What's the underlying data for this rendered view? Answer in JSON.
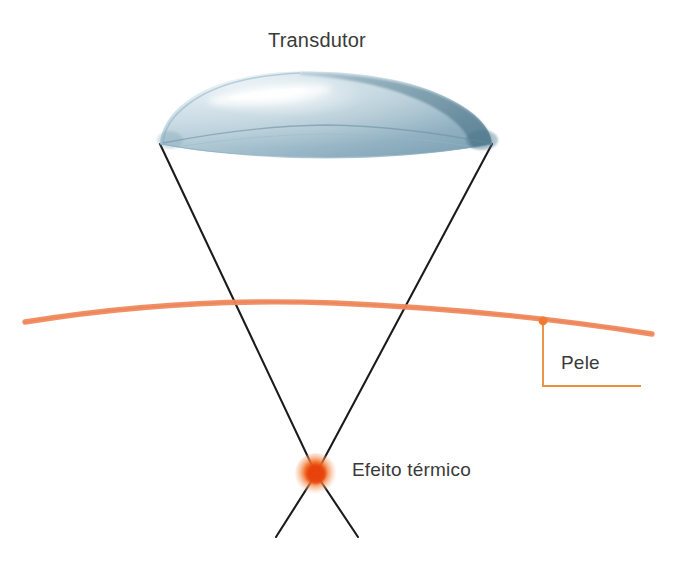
{
  "diagram": {
    "title_text": "Transdutor",
    "background_color": "#ffffff",
    "labels": {
      "transducer": "Transdutor",
      "skin": "Pele",
      "thermal_effect": "Efeito térmico"
    },
    "colors": {
      "text": "#3a3a3a",
      "skin_line": "#f08a5d",
      "leader_line": "#e8913f",
      "focal_core": "#e8420a",
      "focal_mid": "#f26c1e",
      "focal_outer": "#f6a878",
      "beam_line": "#1b1b1b",
      "transducer_light": "#dfe8ee",
      "transducer_mid": "#b5ccd8",
      "transducer_dark": "#6f93a6",
      "transducer_rim": "#4d7689"
    },
    "elements": {
      "transducer": {
        "name": "transducer-dome",
        "left_tip_x": 160,
        "left_tip_y": 144,
        "right_tip_x": 492,
        "right_tip_y": 144,
        "apex_x": 326,
        "apex_y": 72
      },
      "skin_line": {
        "name": "skin-surface-line",
        "start_x": 25,
        "start_y": 322,
        "end_x": 652,
        "end_y": 334,
        "peak_x": 330,
        "peak_y": 302,
        "stroke_width": 5
      },
      "beam_left": {
        "name": "beam-ray-left",
        "from_x": 160,
        "from_y": 144,
        "focus_x": 316,
        "focus_y": 474,
        "to_x": 358,
        "to_y": 537
      },
      "beam_right": {
        "name": "beam-ray-right",
        "from_x": 492,
        "from_y": 144,
        "focus_x": 316,
        "focus_y": 474,
        "to_x": 276,
        "to_y": 537
      },
      "focal_point": {
        "name": "thermal-focal-point",
        "cx": 316,
        "cy": 474,
        "r": 19
      },
      "skin_leader": {
        "name": "skin-leader-line",
        "dot_x": 543,
        "dot_y": 321,
        "dot_r": 4,
        "vertical_to_y": 386,
        "horizontal_to_x": 641
      }
    }
  }
}
